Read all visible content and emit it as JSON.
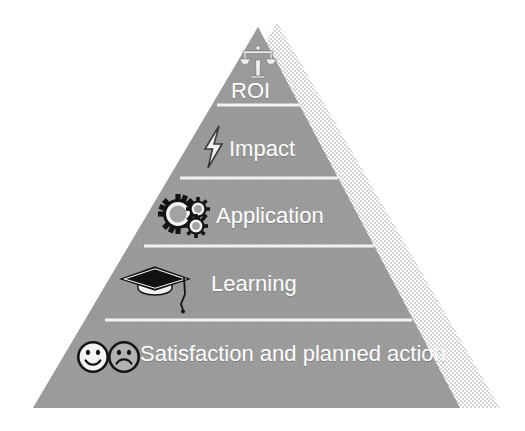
{
  "diagram": {
    "type": "pyramid",
    "title": "",
    "orientation": "apex-up",
    "tier_count": 5,
    "colors": {
      "pyramid_fill": "#9a9a9a",
      "pyramid_fill_dark": "#8e8e8e",
      "shadow_fill": "#dcdcdc",
      "divider": "#f2f2f2",
      "label_text": "#ffffff",
      "icon_light": "#f4f4f4",
      "icon_dark": "#1a1a1a",
      "background": "#ffffff"
    },
    "tiers": [
      {
        "level": 5,
        "label": "ROI",
        "icon": "balance-scales-icon"
      },
      {
        "level": 4,
        "label": "Impact",
        "icon": "lightning-bolt-icon"
      },
      {
        "level": 3,
        "label": "Application",
        "icon": "gears-icon"
      },
      {
        "level": 2,
        "label": "Learning",
        "icon": "graduation-cap-icon"
      },
      {
        "level": 1,
        "label": "Satisfaction and planned action",
        "icon": "smiley-and-frowny-faces-icon"
      }
    ]
  }
}
